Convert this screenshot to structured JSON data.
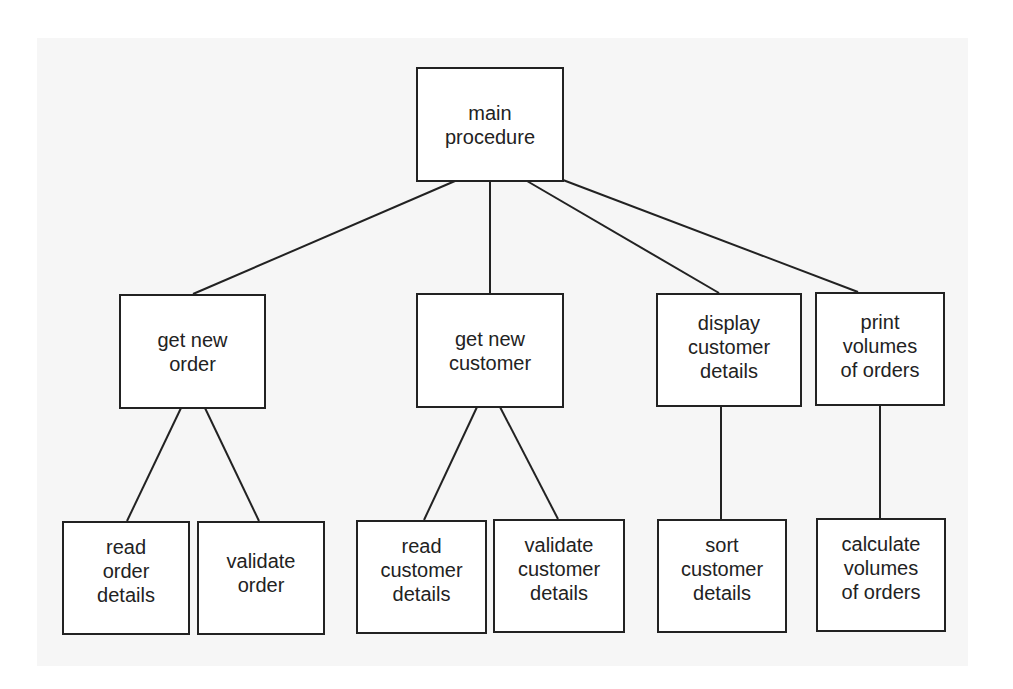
{
  "diagram": {
    "type": "structure-chart",
    "colors": {
      "background": "#ffffff",
      "panel": "#f6f6f6",
      "box_fill": "#ffffff",
      "stroke": "#222222"
    },
    "nodes": {
      "main": {
        "lines": [
          "main",
          "procedure"
        ]
      },
      "get_order": {
        "lines": [
          "get new",
          "order"
        ]
      },
      "get_cust": {
        "lines": [
          "get new",
          "customer"
        ]
      },
      "display": {
        "lines": [
          "display",
          "customer",
          "details"
        ]
      },
      "print": {
        "lines": [
          "print",
          "volumes",
          "of orders"
        ]
      },
      "read_order": {
        "lines": [
          "read",
          "order",
          "details"
        ]
      },
      "valid_order": {
        "lines": [
          "validate",
          "order"
        ]
      },
      "read_cust": {
        "lines": [
          "read",
          "customer",
          "details"
        ]
      },
      "valid_cust": {
        "lines": [
          "validate",
          "customer",
          "details"
        ]
      },
      "sort": {
        "lines": [
          "sort",
          "customer",
          "details"
        ]
      },
      "calculate": {
        "lines": [
          "calculate",
          "volumes",
          "of orders"
        ]
      }
    },
    "edges": [
      [
        "main procedure",
        "get new order"
      ],
      [
        "main procedure",
        "get new customer"
      ],
      [
        "main procedure",
        "display customer details"
      ],
      [
        "main procedure",
        "print volumes of orders"
      ],
      [
        "get new order",
        "read order details"
      ],
      [
        "get new order",
        "validate order"
      ],
      [
        "get new customer",
        "read customer details"
      ],
      [
        "get new customer",
        "validate customer details"
      ],
      [
        "display customer details",
        "sort customer details"
      ],
      [
        "print volumes of orders",
        "calculate volumes of orders"
      ]
    ]
  }
}
